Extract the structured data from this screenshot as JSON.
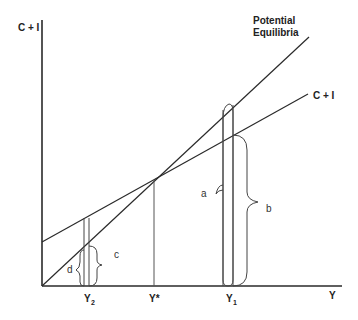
{
  "diagram": {
    "axes": {
      "y_label": "C + I",
      "x_label": "Y"
    },
    "lines": {
      "forty_five": {
        "label_line1": "Potential",
        "label_line2": "Equilibria"
      },
      "ci": {
        "label": "C + I"
      }
    },
    "x_ticks": {
      "y2": {
        "main": "Y",
        "sub": "2"
      },
      "ystar": {
        "main": "Y*"
      },
      "y1": {
        "main": "Y",
        "sub": "1"
      }
    },
    "braces": {
      "a": "a",
      "b": "b",
      "c": "c",
      "d": "d"
    },
    "colors": {
      "line": "#2a2a2a",
      "text": "#222222"
    }
  }
}
